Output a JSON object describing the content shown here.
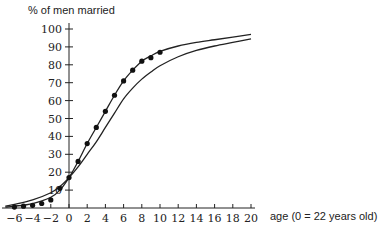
{
  "chart_data": {
    "type": "line",
    "title": "",
    "ylabel": "% of men married",
    "xlabel": "age (0 = 22 years old)",
    "xlim": [
      -7,
      20
    ],
    "ylim": [
      0,
      100
    ],
    "x_ticks": [
      -6,
      -4,
      -2,
      0,
      2,
      4,
      6,
      8,
      10,
      12,
      14,
      16,
      18,
      20
    ],
    "y_ticks": [
      10,
      20,
      30,
      40,
      50,
      60,
      70,
      80,
      90,
      100
    ],
    "grid": false,
    "legend": null,
    "series": [
      {
        "name": "observed data",
        "style": "points",
        "x": [
          -6,
          -5,
          -4,
          -3,
          -2,
          -1,
          0,
          1,
          2,
          3,
          4,
          5,
          6,
          7,
          8,
          9,
          10
        ],
        "values": [
          0.5,
          1,
          1.5,
          2.5,
          4.5,
          11,
          17,
          26,
          36,
          45,
          54,
          63,
          71,
          77,
          82,
          84,
          87
        ]
      },
      {
        "name": "fitted curve (upper)",
        "style": "line",
        "x": [
          -7,
          -6,
          -4,
          -2,
          -1,
          0,
          1,
          2,
          3,
          4,
          5,
          6,
          7,
          8,
          9,
          10,
          12,
          14,
          16,
          18,
          20
        ],
        "values": [
          0.5,
          1,
          2.5,
          6,
          10,
          17,
          26,
          36,
          45,
          54,
          63,
          71,
          77,
          82,
          85,
          87.5,
          90.5,
          92.5,
          94,
          95.5,
          97
        ]
      },
      {
        "name": "fitted curve (lower)",
        "style": "line",
        "x": [
          -7,
          -6,
          -4,
          -2,
          -1,
          0,
          1,
          2,
          3,
          4,
          5,
          6,
          7,
          8,
          9,
          10,
          12,
          14,
          16,
          18,
          20
        ],
        "values": [
          1,
          2,
          4.5,
          8.5,
          12,
          17,
          23,
          30,
          37,
          45,
          53,
          61,
          67,
          72,
          76,
          79.5,
          84.5,
          88,
          90.5,
          92.5,
          94.5
        ]
      }
    ]
  }
}
